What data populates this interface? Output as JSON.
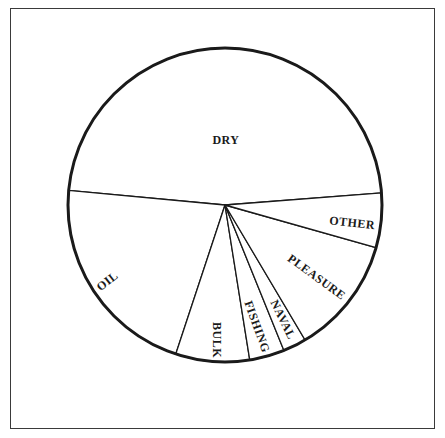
{
  "chart_data": {
    "type": "pie",
    "title": "",
    "center": [
      225,
      205
    ],
    "radius": 157,
    "start_angle_deg": 4.4,
    "direction": "counterclockwise",
    "slices": [
      {
        "label": "DRY",
        "percent": 47.3
      },
      {
        "label": "OIL",
        "percent": 21.4
      },
      {
        "label": "BULK",
        "percent": 7.6
      },
      {
        "label": "FISHING",
        "percent": 3.6
      },
      {
        "label": "NAVAL",
        "percent": 2.4
      },
      {
        "label": "PLEASURE",
        "percent": 12.1
      },
      {
        "label": "OTHER",
        "percent": 5.6
      }
    ],
    "labels": [
      {
        "text": "DRY",
        "x": 226,
        "y": 141,
        "rotate": 0
      },
      {
        "text": "OIL",
        "x": 108,
        "y": 282,
        "rotate": -38
      },
      {
        "text": "BULK",
        "x": 216,
        "y": 340,
        "rotate": 90
      },
      {
        "text": "FISHING",
        "x": 256,
        "y": 327,
        "rotate": 70
      },
      {
        "text": "NAVAL",
        "x": 282,
        "y": 320,
        "rotate": 64
      },
      {
        "text": "PLEASURE",
        "x": 316,
        "y": 278,
        "rotate": 36
      },
      {
        "text": "OTHER",
        "x": 352,
        "y": 224,
        "rotate": 6
      }
    ],
    "colors": {
      "fill": "#ffffff",
      "stroke": "#1a1a1a"
    }
  }
}
